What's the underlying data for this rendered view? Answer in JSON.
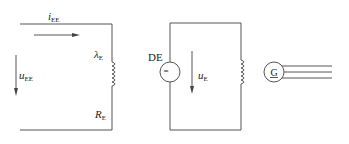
{
  "diagram": {
    "type": "circuit-schematics",
    "left_circuit": {
      "current_label": {
        "main": "i",
        "sub": "EE"
      },
      "voltage_label": {
        "main": "u",
        "sub": "EE"
      },
      "inductance_label": {
        "main": "λ",
        "sub": "E"
      },
      "resistance_label": {
        "main": "R",
        "sub": "E"
      }
    },
    "middle_circuit": {
      "source_label": "DE",
      "source_symbol": "=",
      "voltage_label": {
        "main": "u",
        "sub": "E"
      }
    },
    "right_symbol": {
      "generator_symbol": "G",
      "phase_lines": 3
    },
    "colors": {
      "line": "#555555",
      "text": "#222222",
      "background": "#ffffff"
    }
  }
}
